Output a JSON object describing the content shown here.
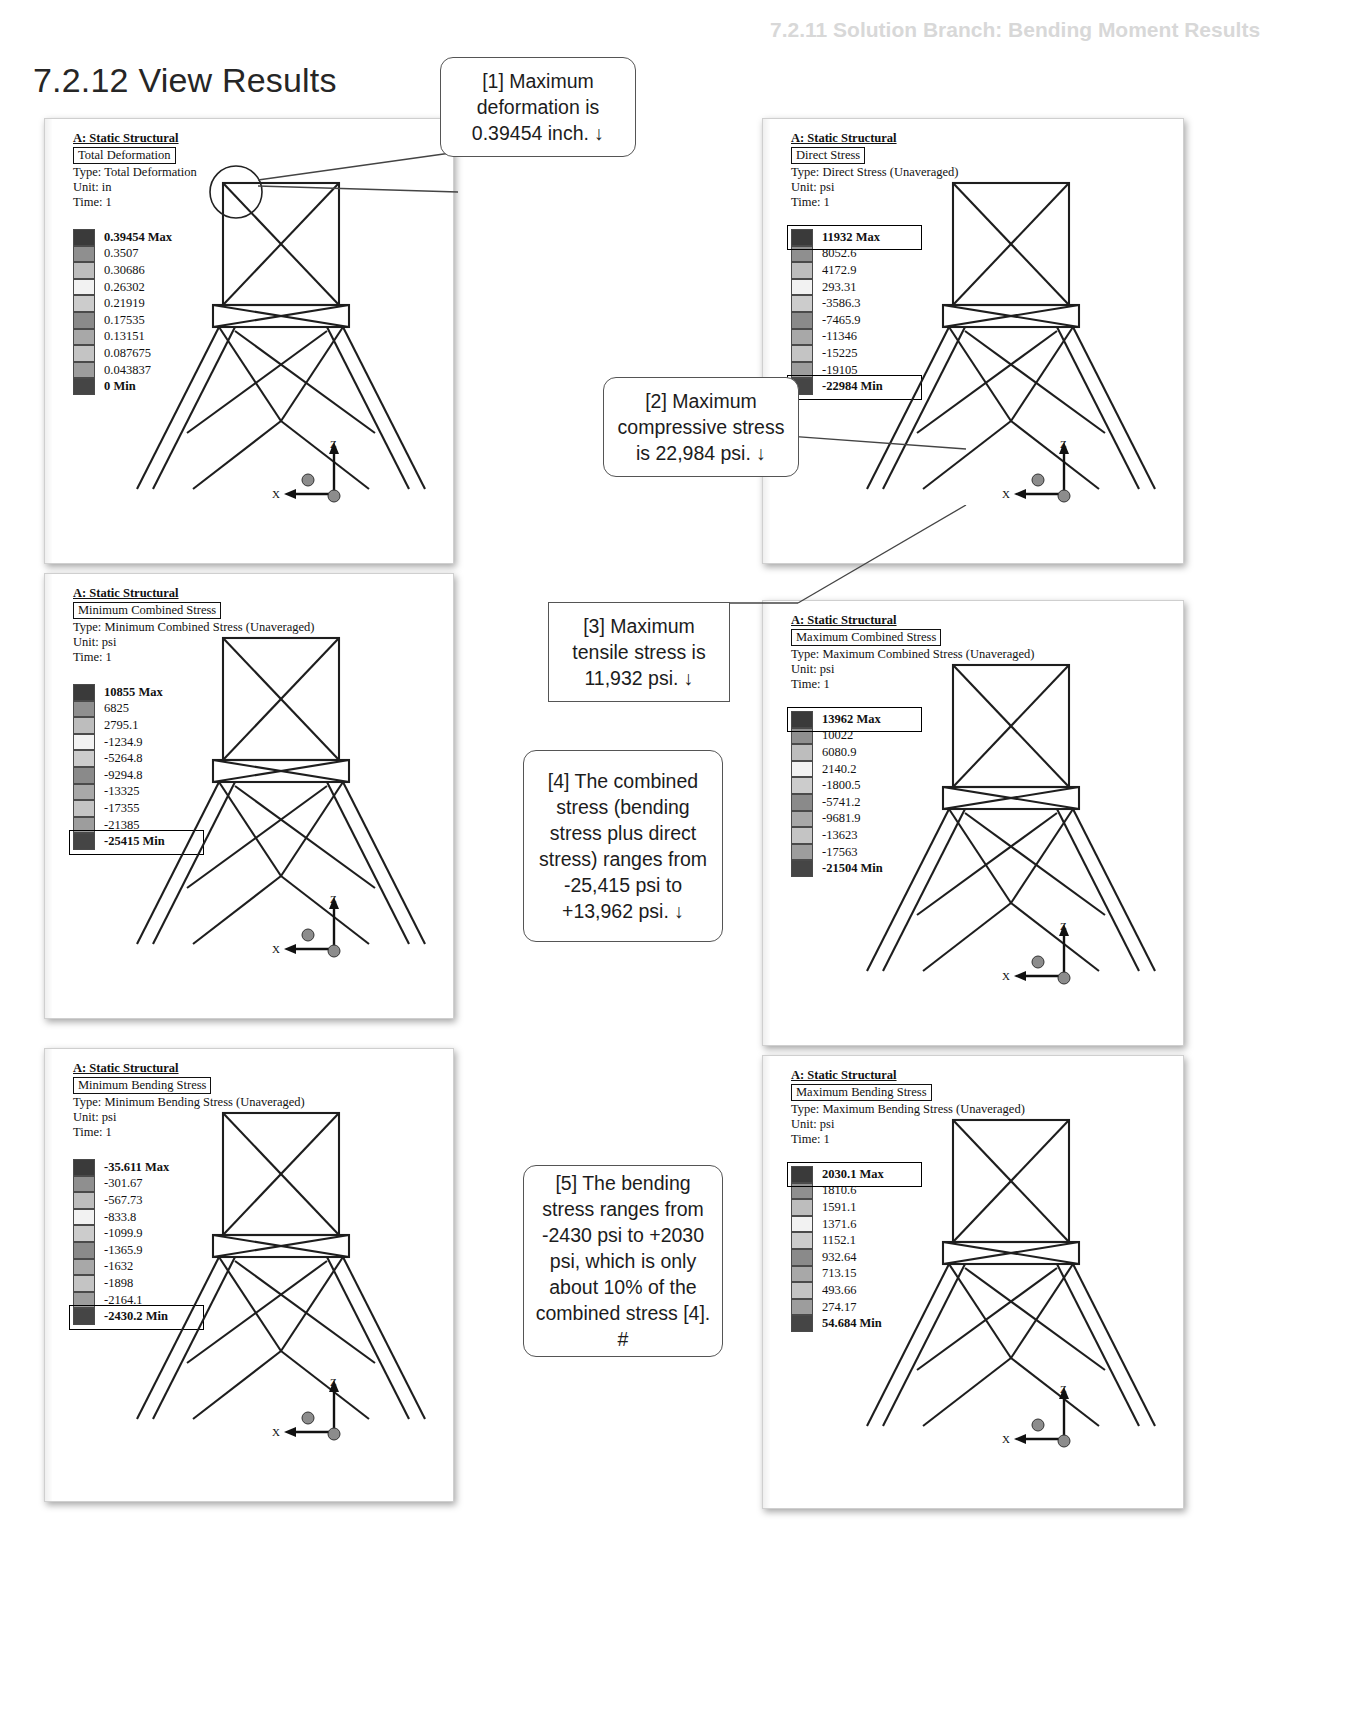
{
  "page": {
    "section_number": "7.2.12",
    "title": "7.2.12 View Results",
    "ghost_header": "7.2.11 Solution Branch: Bending Moment Results"
  },
  "callouts": [
    {
      "id": "callout-1",
      "text": "[1] Maximum deformation is 0.39454 inch. ↓",
      "shape": "rounded"
    },
    {
      "id": "callout-2",
      "text": "[2] Maximum compressive stress is 22,984 psi. ↓",
      "shape": "rounded"
    },
    {
      "id": "callout-3",
      "text": "[3] Maximum tensile stress is 11,932 psi. ↓",
      "shape": "square"
    },
    {
      "id": "callout-4",
      "text": "[4] The combined stress (bending stress plus direct stress) ranges from -25,415 psi to +13,962 psi. ↓",
      "shape": "rounded"
    },
    {
      "id": "callout-5",
      "text": "[5] The bending stress ranges from -2430 psi to +2030 psi, which is only about 10% of the combined stress [4].  #",
      "shape": "rounded"
    }
  ],
  "panels": [
    {
      "id": "panel-total-deformation",
      "analysis": "A: Static Structural",
      "result_name": "Total Deformation",
      "type_line": "Type: Total Deformation",
      "unit_line": "Unit: in",
      "time_line": "Time: 1",
      "max_boxed": false,
      "min_boxed": false,
      "axis_x": "X",
      "axis_z": "Z",
      "legend": [
        "0.39454 Max",
        "0.3507",
        "0.30686",
        "0.26302",
        "0.21919",
        "0.17535",
        "0.13151",
        "0.087675",
        "0.043837",
        "0 Min"
      ]
    },
    {
      "id": "panel-direct-stress",
      "analysis": "A: Static Structural",
      "result_name": "Direct Stress",
      "type_line": "Type: Direct Stress (Unaveraged)",
      "unit_line": "Unit: psi",
      "time_line": "Time: 1",
      "max_boxed": true,
      "min_boxed": true,
      "axis_x": "X",
      "axis_z": "Z",
      "legend": [
        "11932 Max",
        "8052.6",
        "4172.9",
        "293.31",
        "-3586.3",
        "-7465.9",
        "-11346",
        "-15225",
        "-19105",
        "-22984 Min"
      ]
    },
    {
      "id": "panel-minimum-combined-stress",
      "analysis": "A: Static Structural",
      "result_name": "Minimum Combined Stress",
      "type_line": "Type: Minimum Combined Stress (Unaveraged)",
      "unit_line": "Unit: psi",
      "time_line": "Time: 1",
      "max_boxed": false,
      "min_boxed": true,
      "axis_x": "X",
      "axis_z": "Z",
      "legend": [
        "10855 Max",
        "6825",
        "2795.1",
        "-1234.9",
        "-5264.8",
        "-9294.8",
        "-13325",
        "-17355",
        "-21385",
        "-25415 Min"
      ]
    },
    {
      "id": "panel-maximum-combined-stress",
      "analysis": "A: Static Structural",
      "result_name": "Maximum Combined Stress",
      "type_line": "Type: Maximum Combined Stress (Unaveraged)",
      "unit_line": "Unit: psi",
      "time_line": "Time: 1",
      "max_boxed": true,
      "min_boxed": false,
      "axis_x": "X",
      "axis_z": "Z",
      "legend": [
        "13962 Max",
        "10022",
        "6080.9",
        "2140.2",
        "-1800.5",
        "-5741.2",
        "-9681.9",
        "-13623",
        "-17563",
        "-21504 Min"
      ]
    },
    {
      "id": "panel-minimum-bending-stress",
      "analysis": "A: Static Structural",
      "result_name": "Minimum Bending Stress",
      "type_line": "Type: Minimum Bending Stress (Unaveraged)",
      "unit_line": "Unit: psi",
      "time_line": "Time: 1",
      "max_boxed": false,
      "min_boxed": true,
      "axis_x": "X",
      "axis_z": "Z",
      "legend": [
        "-35.611 Max",
        "-301.67",
        "-567.73",
        "-833.8",
        "-1099.9",
        "-1365.9",
        "-1632",
        "-1898",
        "-2164.1",
        "-2430.2 Min"
      ]
    },
    {
      "id": "panel-maximum-bending-stress",
      "analysis": "A: Static Structural",
      "result_name": "Maximum Bending Stress",
      "type_line": "Type: Maximum Bending Stress (Unaveraged)",
      "unit_line": "Unit: psi",
      "time_line": "Time: 1",
      "max_boxed": true,
      "min_boxed": false,
      "axis_x": "X",
      "axis_z": "Z",
      "legend": [
        "2030.1 Max",
        "1810.6",
        "1591.1",
        "1371.6",
        "1152.1",
        "932.64",
        "713.15",
        "493.66",
        "274.17",
        "54.684 Min"
      ]
    }
  ],
  "legend_colors": [
    "#3a3a3a",
    "#8f8f8f",
    "#bdbdbd",
    "#f2f2f2",
    "#cccccc",
    "#8a8a8a",
    "#a8a8a8",
    "#c4c4c4",
    "#9d9d9d",
    "#454545"
  ]
}
